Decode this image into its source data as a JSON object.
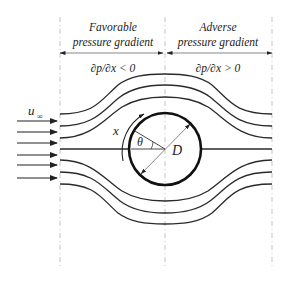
{
  "diagram": {
    "type": "flow-over-cylinder",
    "regions": [
      {
        "title_line1": "Favorable",
        "title_line2": "pressure gradient",
        "condition": "∂p/∂x < 0"
      },
      {
        "title_line1": "Adverse",
        "title_line2": "pressure gradient",
        "condition": "∂p/∂x > 0"
      }
    ],
    "freestream_label": "u",
    "freestream_subscript": "∞",
    "arc_length_label": "x",
    "angle_label": "θ",
    "diameter_label": "D",
    "colors": {
      "line": "#2a2a2a",
      "cylinder": "#111111",
      "dashed_guides": "#b5b5b5",
      "background": "#ffffff"
    },
    "freestream_arrow_count": 6,
    "streamline_count": 7
  }
}
